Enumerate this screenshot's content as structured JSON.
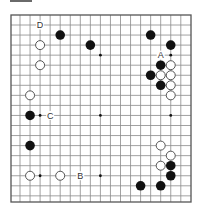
{
  "diagram": {
    "type": "go-board-partial",
    "colors": {
      "line": "#8a8a8a",
      "frame": "#555555",
      "black_stone": "#111111",
      "white_stone": "#ffffff",
      "white_outline": "#444444",
      "label": "#333333"
    },
    "columns": 17,
    "rows": 18,
    "star_points": [
      [
        8,
        3
      ],
      [
        15,
        3
      ],
      [
        8,
        9
      ],
      [
        2,
        9
      ],
      [
        15,
        9
      ],
      [
        2,
        15
      ],
      [
        8,
        15
      ],
      [
        15,
        15
      ]
    ],
    "stones": [
      {
        "color": "black",
        "col": 4,
        "row": 1
      },
      {
        "color": "black",
        "col": 7,
        "row": 2
      },
      {
        "color": "white",
        "col": 2,
        "row": 2
      },
      {
        "color": "white",
        "col": 2,
        "row": 4
      },
      {
        "color": "black",
        "col": 13,
        "row": 1
      },
      {
        "color": "black",
        "col": 15,
        "row": 2
      },
      {
        "color": "black",
        "col": 14,
        "row": 4
      },
      {
        "color": "white",
        "col": 15,
        "row": 4
      },
      {
        "color": "black",
        "col": 13,
        "row": 5
      },
      {
        "color": "white",
        "col": 14,
        "row": 5
      },
      {
        "color": "white",
        "col": 15,
        "row": 5
      },
      {
        "color": "black",
        "col": 14,
        "row": 6
      },
      {
        "color": "white",
        "col": 15,
        "row": 6
      },
      {
        "color": "white",
        "col": 15,
        "row": 7
      },
      {
        "color": "white",
        "col": 1,
        "row": 7
      },
      {
        "color": "black",
        "col": 1,
        "row": 9
      },
      {
        "color": "black",
        "col": 1,
        "row": 12
      },
      {
        "color": "white",
        "col": 1,
        "row": 15
      },
      {
        "color": "white",
        "col": 4,
        "row": 15
      },
      {
        "color": "white",
        "col": 14,
        "row": 12
      },
      {
        "color": "white",
        "col": 15,
        "row": 13
      },
      {
        "color": "white",
        "col": 14,
        "row": 14
      },
      {
        "color": "black",
        "col": 15,
        "row": 14
      },
      {
        "color": "black",
        "col": 15,
        "row": 15
      },
      {
        "color": "black",
        "col": 12,
        "row": 16
      },
      {
        "color": "black",
        "col": 14,
        "row": 16
      }
    ],
    "labels": [
      {
        "text": "D",
        "col": 2,
        "row": 0
      },
      {
        "text": "A",
        "col": 14,
        "row": 3
      },
      {
        "text": "C",
        "col": 3,
        "row": 9
      },
      {
        "text": "B",
        "col": 6,
        "row": 15
      }
    ]
  }
}
